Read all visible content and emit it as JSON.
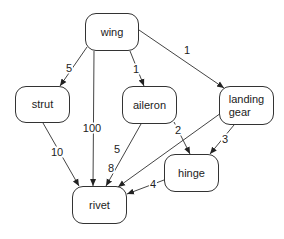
{
  "diagram": {
    "type": "directed-graph",
    "nodes": [
      {
        "id": "wing",
        "label": "wing",
        "x": 85,
        "y": 13,
        "w": 54,
        "h": 38
      },
      {
        "id": "strut",
        "label": "strut",
        "x": 15,
        "y": 86,
        "w": 55,
        "h": 37
      },
      {
        "id": "aileron",
        "label": "aileron",
        "x": 122,
        "y": 86,
        "w": 55,
        "h": 38
      },
      {
        "id": "landing_gear",
        "label": "landing\ngear",
        "x": 219,
        "y": 86,
        "w": 55,
        "h": 39
      },
      {
        "id": "hinge",
        "label": "hinge",
        "x": 164,
        "y": 154,
        "w": 55,
        "h": 38
      },
      {
        "id": "rivet",
        "label": "rivet",
        "x": 72,
        "y": 186,
        "w": 55,
        "h": 38
      }
    ],
    "edges": [
      {
        "from": "wing",
        "to": "strut",
        "label": "5"
      },
      {
        "from": "wing",
        "to": "rivet",
        "label": "100"
      },
      {
        "from": "wing",
        "to": "aileron",
        "label": "1"
      },
      {
        "from": "wing",
        "to": "landing_gear",
        "label": "1"
      },
      {
        "from": "strut",
        "to": "rivet",
        "label": "10"
      },
      {
        "from": "aileron",
        "to": "rivet",
        "label": "5"
      },
      {
        "from": "aileron",
        "to": "hinge",
        "label": "2"
      },
      {
        "from": "landing_gear",
        "to": "rivet",
        "label": "8"
      },
      {
        "from": "landing_gear",
        "to": "hinge",
        "label": "3"
      },
      {
        "from": "hinge",
        "to": "rivet",
        "label": "4"
      }
    ]
  }
}
